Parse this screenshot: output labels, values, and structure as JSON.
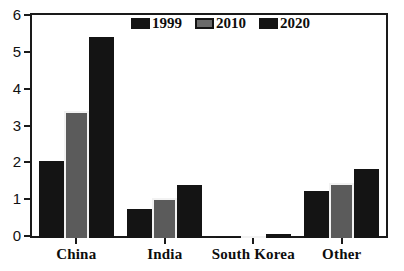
{
  "chart_data": {
    "type": "bar",
    "title": "",
    "subtitle": "",
    "xlabel": "",
    "ylabel": "",
    "categories": [
      "China",
      "India",
      "South Korea",
      "Other"
    ],
    "series": [
      {
        "name": "1999",
        "color": "#141414",
        "values": [
          2.1,
          0.78,
          0.02,
          1.29
        ]
      },
      {
        "name": "2010",
        "color": "#5b5b5b",
        "values": [
          3.45,
          1.08,
          0.04,
          1.5
        ]
      },
      {
        "name": "2020",
        "color": "#141414",
        "values": [
          5.45,
          1.43,
          0.12,
          1.87
        ]
      }
    ],
    "ylim": [
      0,
      6
    ],
    "ytick_labels": [
      "0",
      "1",
      "2",
      "3",
      "4",
      "5",
      "6"
    ],
    "ytick_values": [
      0,
      1,
      2,
      3,
      4,
      5,
      6
    ],
    "grid": false,
    "legend_position": "top-center",
    "legend_entries": [
      "1999",
      "2010",
      "2020"
    ],
    "annotations": []
  },
  "colors": {
    "axis": "#1a1a1a",
    "background": "#ffffff",
    "bar_dark": "#141414",
    "bar_gray": "#5b5b5b",
    "bar_gray_outline": "#f2f2f2",
    "text": "#0d0d0d"
  }
}
